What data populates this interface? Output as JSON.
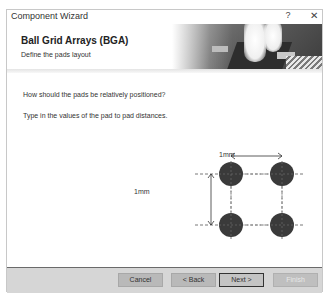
{
  "window": {
    "title": "Component Wizard",
    "help_label": "?",
    "close_label": "✕"
  },
  "header": {
    "title": "Ball Grid Arrays (BGA)",
    "subtitle": "Define the pads layout"
  },
  "content": {
    "question": "How should the pads be relatively positioned?",
    "instruction": "Type in the values of the pad to pad distances.",
    "horizontal_distance": "1mm",
    "vertical_distance": "1mm"
  },
  "diagram": {
    "pad_color": "#3a3a3a",
    "pad_rows": 2,
    "pad_cols": 2
  },
  "buttons": {
    "cancel": {
      "label": "Cancel",
      "mnemonic": "C"
    },
    "back": {
      "label": "< Back",
      "mnemonic": "B"
    },
    "next": {
      "label": "Next >",
      "mnemonic": "N"
    },
    "finish": {
      "label": "Finish",
      "mnemonic": "F",
      "disabled": true
    }
  }
}
